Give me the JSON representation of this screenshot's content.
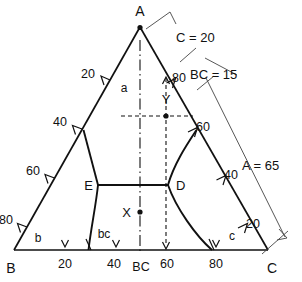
{
  "figure": {
    "type": "ternary-phase-diagram",
    "title": "",
    "vertices": [
      {
        "name": "A",
        "label": "A",
        "x": 140,
        "y": 27,
        "position": "top"
      },
      {
        "name": "B",
        "label": "B",
        "x": 14,
        "y": 250,
        "position": "bottom-left"
      },
      {
        "name": "C",
        "label": "C",
        "x": 268,
        "y": 250,
        "position": "bottom-right"
      }
    ],
    "axis_bottom": {
      "name": "BC",
      "center_label": "BC",
      "ticks": [
        {
          "label": "20",
          "x": 65
        },
        {
          "label": "40",
          "x": 116
        },
        {
          "label": "60",
          "x": 166
        },
        {
          "label": "80",
          "x": 216
        }
      ]
    },
    "axis_left": {
      "name": "AB",
      "ticks": [
        {
          "label": "20"
        },
        {
          "label": "40"
        },
        {
          "label": "60"
        },
        {
          "label": "80"
        }
      ]
    },
    "axis_right": {
      "name": "AC",
      "ticks": [
        {
          "label": "80"
        },
        {
          "label": "60"
        },
        {
          "label": "40"
        },
        {
          "label": "20"
        }
      ]
    },
    "regions": [
      {
        "name": "region-a",
        "label": "a"
      },
      {
        "name": "region-b",
        "label": "b"
      },
      {
        "name": "region-c",
        "label": "c"
      },
      {
        "name": "region-bc",
        "label": "bc"
      }
    ],
    "points": [
      {
        "name": "X",
        "label": "X",
        "x": 140,
        "y": 212,
        "marker": "dot"
      },
      {
        "name": "Y",
        "label": "Y",
        "x": 166,
        "y": 116,
        "marker": "dot"
      },
      {
        "name": "D",
        "label": "D",
        "x": 168,
        "y": 185,
        "marker": "vertex"
      },
      {
        "name": "E",
        "label": "E",
        "x": 98,
        "y": 185,
        "marker": "vertex"
      }
    ],
    "dimensions": [
      {
        "name": "dim-C",
        "label": "C = 20",
        "value": 20,
        "component": "C"
      },
      {
        "name": "dim-BC",
        "label": "BC = 15",
        "value": 15,
        "component": "BC"
      },
      {
        "name": "dim-A",
        "label": "A = 65",
        "value": 65,
        "component": "A"
      }
    ],
    "colors": {
      "line": "#111111",
      "thin": "#555555",
      "background": "#ffffff"
    }
  }
}
